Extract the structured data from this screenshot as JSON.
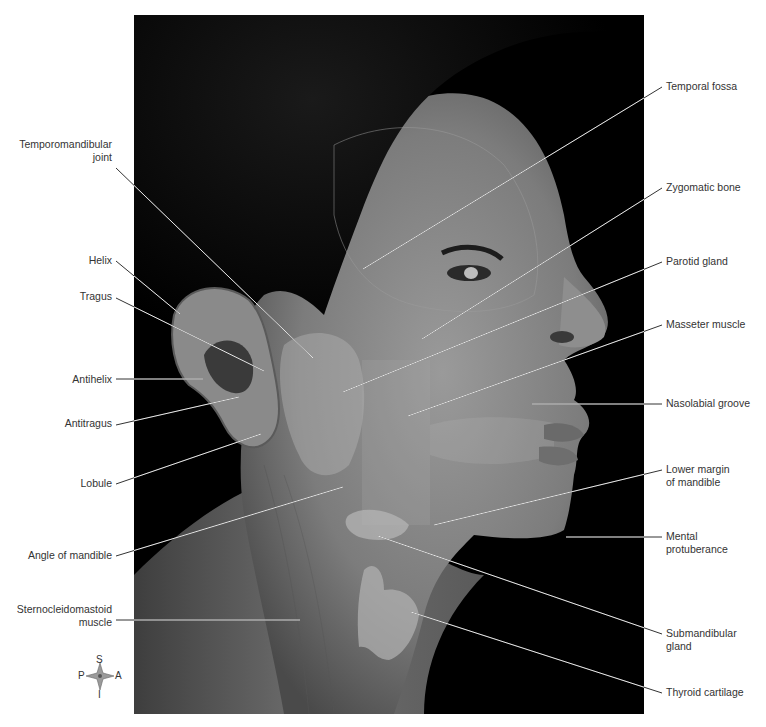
{
  "figure": {
    "photo_box": {
      "x": 134,
      "y": 15,
      "w": 510,
      "h": 699
    },
    "colors": {
      "background": "#ffffff",
      "photo_bg": "#000000",
      "leader": "#e8e8e8",
      "label_text": "#333333"
    }
  },
  "labels_left": [
    {
      "id": "temporomandibular-joint",
      "lines": [
        "Temporomandibular",
        "joint"
      ],
      "x": 112,
      "y": 138,
      "from": [
        116,
        168
      ],
      "to": [
        313,
        358
      ]
    },
    {
      "id": "helix",
      "lines": [
        "Helix"
      ],
      "x": 112,
      "y": 254,
      "from": [
        116,
        261
      ],
      "to": [
        180,
        314
      ]
    },
    {
      "id": "tragus",
      "lines": [
        "Tragus"
      ],
      "x": 112,
      "y": 290,
      "from": [
        116,
        298
      ],
      "to": [
        264,
        371
      ]
    },
    {
      "id": "antihelix",
      "lines": [
        "Antihelix"
      ],
      "x": 112,
      "y": 373,
      "from": [
        116,
        379
      ],
      "to": [
        203,
        379
      ]
    },
    {
      "id": "antitragus",
      "lines": [
        "Antitragus"
      ],
      "x": 112,
      "y": 417,
      "from": [
        116,
        425
      ],
      "to": [
        239,
        397
      ]
    },
    {
      "id": "lobule",
      "lines": [
        "Lobule"
      ],
      "x": 112,
      "y": 477,
      "from": [
        116,
        484
      ],
      "to": [
        261,
        434
      ]
    },
    {
      "id": "angle-of-mandible",
      "lines": [
        "Angle of mandible"
      ],
      "x": 112,
      "y": 549,
      "from": [
        116,
        556
      ],
      "to": [
        343,
        487
      ]
    },
    {
      "id": "sternocleidomastoid-muscle",
      "lines": [
        "Sternocleidomastoid",
        "muscle"
      ],
      "x": 112,
      "y": 603,
      "from": [
        116,
        620
      ],
      "to": [
        300,
        620
      ]
    }
  ],
  "labels_right": [
    {
      "id": "temporal-fossa",
      "lines": [
        "Temporal fossa"
      ],
      "x": 666,
      "y": 80,
      "from": [
        662,
        87
      ],
      "to": [
        363,
        269
      ]
    },
    {
      "id": "zygomatic-bone",
      "lines": [
        "Zygomatic bone"
      ],
      "x": 666,
      "y": 181,
      "from": [
        662,
        188
      ],
      "to": [
        422,
        339
      ]
    },
    {
      "id": "parotid-gland",
      "lines": [
        "Parotid gland"
      ],
      "x": 666,
      "y": 255,
      "from": [
        662,
        262
      ],
      "to": [
        343,
        392
      ]
    },
    {
      "id": "masseter-muscle",
      "lines": [
        "Masseter muscle"
      ],
      "x": 666,
      "y": 318,
      "from": [
        662,
        325
      ],
      "to": [
        408,
        416
      ]
    },
    {
      "id": "nasolabial-groove",
      "lines": [
        "Nasolabial groove"
      ],
      "x": 666,
      "y": 397,
      "from": [
        662,
        404
      ],
      "to": [
        532,
        404
      ]
    },
    {
      "id": "lower-margin-of-mandible",
      "lines": [
        "Lower margin",
        "of mandible"
      ],
      "x": 666,
      "y": 463,
      "from": [
        662,
        470
      ],
      "to": [
        434,
        525
      ]
    },
    {
      "id": "mental-protuberance",
      "lines": [
        "Mental",
        "protuberance"
      ],
      "x": 666,
      "y": 530,
      "from": [
        662,
        537
      ],
      "to": [
        566,
        537
      ]
    },
    {
      "id": "submandibular-gland",
      "lines": [
        "Submandibular",
        "gland"
      ],
      "x": 666,
      "y": 627,
      "from": [
        662,
        634
      ],
      "to": [
        378,
        536
      ]
    },
    {
      "id": "thyroid-cartilage",
      "lines": [
        "Thyroid cartilage"
      ],
      "x": 666,
      "y": 686,
      "from": [
        662,
        693
      ],
      "to": [
        411,
        612
      ]
    }
  ],
  "compass": {
    "superior": "S",
    "inferior": "I",
    "posterior": "P",
    "anterior": "A"
  }
}
